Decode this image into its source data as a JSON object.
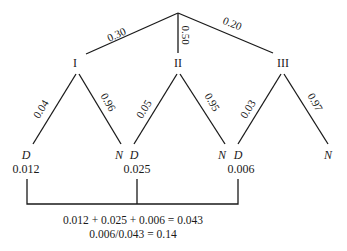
{
  "diagram": {
    "type": "probability-tree",
    "root_branches": [
      {
        "label": "I",
        "probability": "0.30"
      },
      {
        "label": "II",
        "probability": "0.50"
      },
      {
        "label": "III",
        "probability": "0.20"
      }
    ],
    "sub_branches": [
      {
        "parent": "I",
        "d_prob": "0.04",
        "n_prob": "0.96",
        "d_label": "D",
        "n_label": "N",
        "d_value": "0.012"
      },
      {
        "parent": "II",
        "d_prob": "0.05",
        "n_prob": "0.95",
        "d_label": "D",
        "n_label": "N",
        "d_value": "0.025"
      },
      {
        "parent": "III",
        "d_prob": "0.03",
        "n_prob": "0.97",
        "d_label": "D",
        "n_label": "N",
        "d_value": "0.006"
      }
    ],
    "equations": [
      "0.012 + 0.025 + 0.006 = 0.043",
      "0.006/0.043 = 0.14"
    ]
  }
}
